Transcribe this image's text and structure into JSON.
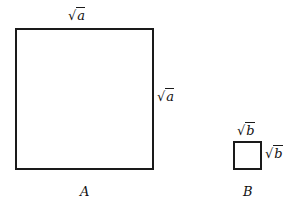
{
  "diagram": {
    "square_a": {
      "top_label_radical": "√",
      "top_label_var": "a",
      "side_label_radical": "√",
      "side_label_var": "a",
      "caption": "A"
    },
    "square_b": {
      "top_label_radical": "√",
      "top_label_var": "b",
      "side_label_radical": "√",
      "side_label_var": "b",
      "caption": "B"
    }
  }
}
